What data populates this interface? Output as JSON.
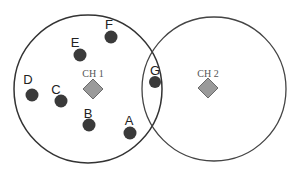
{
  "diagram": {
    "type": "cluster-network",
    "clusters": [
      {
        "id": "cluster-1",
        "head_label": "CH 1",
        "cx": 88,
        "cy": 89,
        "r": 74
      },
      {
        "id": "cluster-2",
        "head_label": "CH 2",
        "cx": 214,
        "cy": 89,
        "r": 72
      }
    ],
    "nodes": [
      {
        "label": "A",
        "x": 130,
        "y": 133,
        "lx": 129,
        "ly": 121
      },
      {
        "label": "B",
        "x": 89,
        "y": 125,
        "lx": 88,
        "ly": 114
      },
      {
        "label": "C",
        "x": 61,
        "y": 101,
        "lx": 56,
        "ly": 92
      },
      {
        "label": "D",
        "x": 32,
        "y": 95,
        "lx": 28,
        "ly": 82
      },
      {
        "label": "E",
        "x": 80,
        "y": 55,
        "lx": 75,
        "ly": 45
      },
      {
        "label": "F",
        "x": 111,
        "y": 37,
        "lx": 109,
        "ly": 27
      },
      {
        "label": "G",
        "x": 155,
        "y": 82,
        "lx": 155,
        "ly": 71
      }
    ],
    "colors": {
      "circle_stroke": "#333333",
      "node_fill": "#3a3a3a",
      "head_fill": "#9a9a9a",
      "head_stroke": "#6a6a6a"
    }
  }
}
